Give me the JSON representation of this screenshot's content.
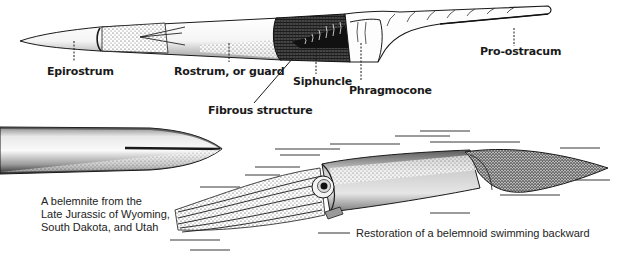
{
  "figure": {
    "top_diagram": {
      "subject": "belemnite-shell-cutaway",
      "labels": [
        {
          "id": "epirostrum",
          "text": "Epirostrum"
        },
        {
          "id": "rostrum",
          "text": "Rostrum, or guard"
        },
        {
          "id": "fibrous",
          "text": "Fibrous structure"
        },
        {
          "id": "siphuncle",
          "text": "Siphuncle"
        },
        {
          "id": "phragmocone",
          "text": "Phragmocone"
        },
        {
          "id": "pro_ostracum",
          "text": "Pro-ostracum"
        }
      ]
    },
    "fossil": {
      "caption_lines": [
        "A belemnite from the",
        "Late Jurassic of Wyoming,",
        "South Dakota, and Utah"
      ]
    },
    "restoration": {
      "caption": "Restoration of a belemnoid swimming backward"
    },
    "colors": {
      "ink": "#1a1a1a",
      "background": "#ffffff",
      "stipple": "#555555"
    }
  }
}
